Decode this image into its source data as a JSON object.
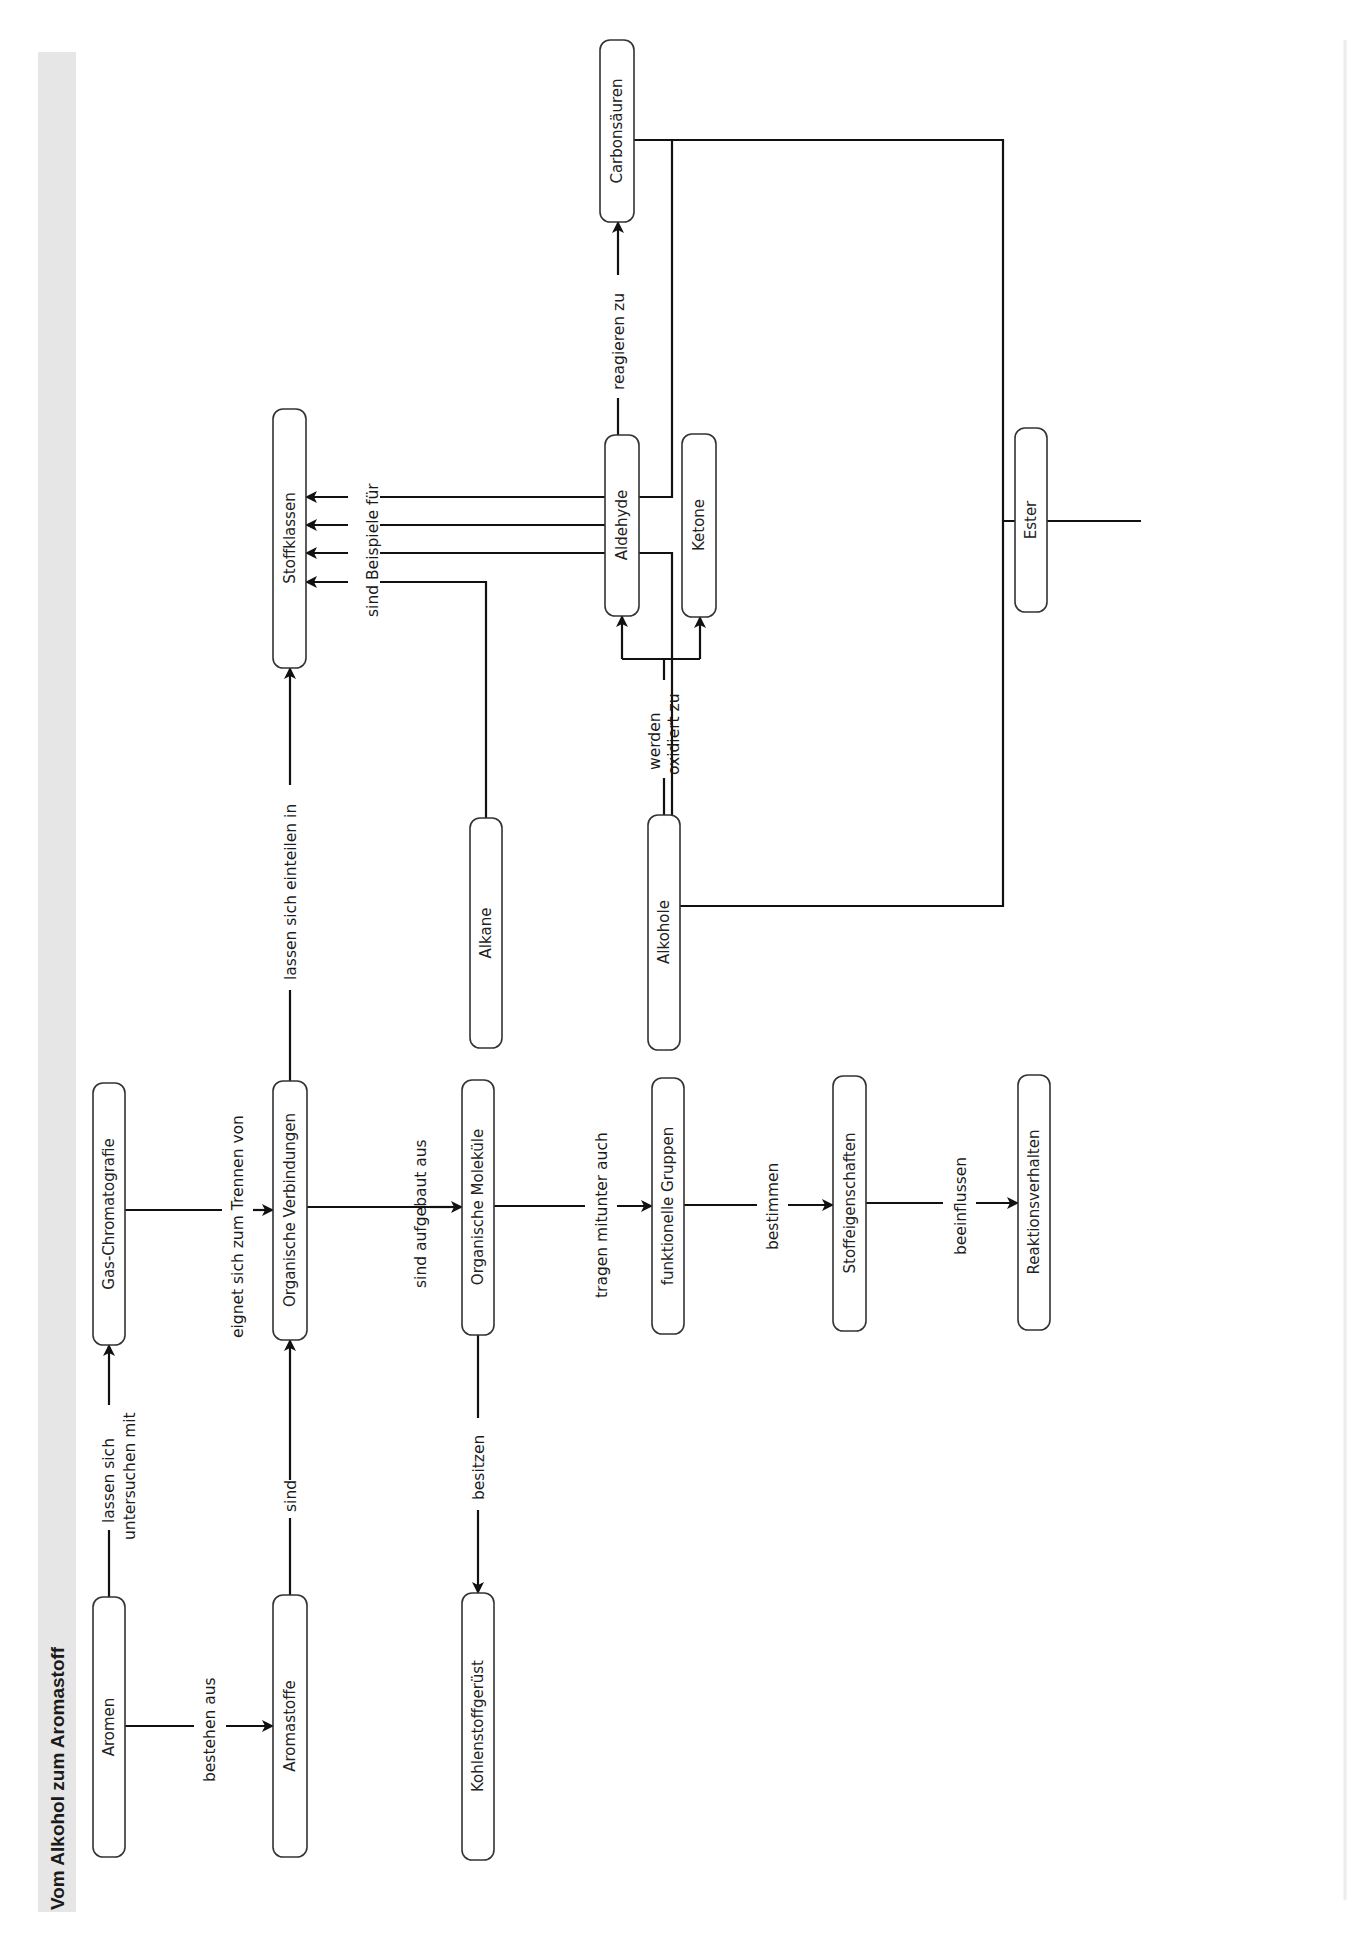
{
  "title": "Vom Alkohol zum Aromastoff",
  "colors": {
    "title_band": "#e6e6e6",
    "line": "#111111",
    "box_border": "#333333",
    "background": "#ffffff"
  },
  "nodes": {
    "aromen": "Aromen",
    "aromastoffe": "Aromastoffe",
    "gas_chromatografie": "Gas-Chromatografie",
    "organische_verbindungen": "Organische Verbindungen",
    "organische_molekuele": "Organische Moleküle",
    "kohlenstoffgeruest": "Kohlenstoffgerüst",
    "funktionelle_gruppen": "funktionelle Gruppen",
    "stoffeigenschaften": "Stoffeigenschaften",
    "reaktionsverhalten": "Reaktionsverhalten",
    "stoffklassen": "Stoffklassen",
    "alkane": "Alkane",
    "alkohole": "Alkohole",
    "aldehyde": "Aldehyde",
    "ketone": "Ketone",
    "carbonsaeuren": "Carbonsäuren",
    "ester": "Ester"
  },
  "edges": {
    "bestehen_aus": "bestehen aus",
    "lassen_sich_untersuchen_mit_1": "lassen sich",
    "lassen_sich_untersuchen_mit_2": "untersuchen mit",
    "sind": "sind",
    "eignet_sich_zum_trennen_von": "eignet sich zum Trennen von",
    "sind_aufgebaut_aus": "sind aufgebaut aus",
    "besitzen": "besitzen",
    "tragen_mitunter_auch": "tragen mitunter auch",
    "bestimmen": "bestimmen",
    "beeinflussen": "beeinflussen",
    "lassen_sich_einteilen_in": "lassen sich einteilen in",
    "sind_beispiele_fuer": "sind Beispiele für",
    "werden_oxidiert_zu_1": "werden",
    "werden_oxidiert_zu_2": "oxidiert zu",
    "reagieren_zu_carbonsaeuren": "reagieren zu",
    "reagieren_zu_ester": "reagieren zu"
  }
}
